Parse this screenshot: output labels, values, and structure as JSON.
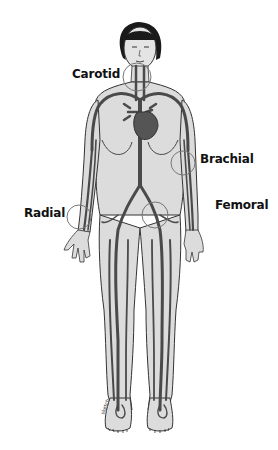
{
  "diagram": {
    "colors": {
      "skin": "#dcdcdc",
      "outline": "#333333",
      "vessel": "#4a4a4a",
      "heart": "#555555",
      "hair": "#1a1a1a",
      "label": "#111111"
    },
    "labels": [
      {
        "id": "carotid",
        "text": "Carotid",
        "x": 72,
        "y": 67
      },
      {
        "id": "brachial",
        "text": "Brachial",
        "x": 200,
        "y": 152
      },
      {
        "id": "femoral",
        "text": "Femoral",
        "x": 215,
        "y": 198
      },
      {
        "id": "radial",
        "text": "Radial",
        "x": 24,
        "y": 206
      }
    ],
    "pulse_circles": [
      {
        "id": "carotid",
        "cx": 137,
        "cy": 77,
        "r": 14
      },
      {
        "id": "brachial",
        "cx": 183,
        "cy": 163,
        "r": 12
      },
      {
        "id": "femoral",
        "cx": 155,
        "cy": 215,
        "r": 13
      },
      {
        "id": "radial",
        "cx": 79,
        "cy": 217,
        "r": 12
      }
    ]
  }
}
